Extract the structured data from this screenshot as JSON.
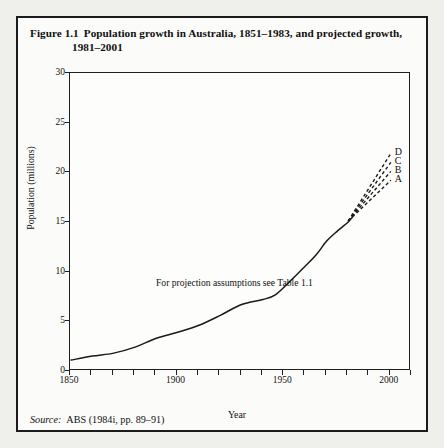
{
  "figure": {
    "number": "Figure 1.1",
    "caption_line1": "Population growth in Australia, 1851–1983, and projected growth,",
    "caption_line2": "1981–2001",
    "source_word": "Source:",
    "source_text": "ABS (1984i, pp. 89–91)",
    "annotation": "For projection assumptions see Table 1.1"
  },
  "chart_data": {
    "type": "line",
    "title": "Population growth in Australia, 1851–1983, and projected growth, 1981–2001",
    "xlabel": "Year",
    "ylabel": "Population (millions)",
    "xlim": [
      1850,
      2010
    ],
    "ylim": [
      0,
      30
    ],
    "xticks_labeled": [
      1850,
      1900,
      1950,
      2000
    ],
    "xticks_minor_step": 10,
    "yticks": [
      0,
      5,
      10,
      15,
      20,
      25,
      30
    ],
    "grid": false,
    "legend": "inline-labels",
    "annotations": [
      "For projection assumptions see Table 1.1"
    ],
    "series": [
      {
        "name": "Actual population 1851–1983",
        "style": "solid",
        "x": [
          1851,
          1861,
          1871,
          1881,
          1891,
          1901,
          1911,
          1921,
          1931,
          1941,
          1947,
          1954,
          1961,
          1966,
          1971,
          1976,
          1981,
          1983
        ],
        "values": [
          1.0,
          1.4,
          1.7,
          2.3,
          3.2,
          3.8,
          4.5,
          5.5,
          6.6,
          7.1,
          7.6,
          9.0,
          10.5,
          11.6,
          13.0,
          14.0,
          14.9,
          15.4
        ]
      },
      {
        "name": "A",
        "style": "dashed",
        "label": "A",
        "x": [
          1981,
          2001
        ],
        "values": [
          15.0,
          19.1
        ]
      },
      {
        "name": "B",
        "style": "dashed",
        "label": "B",
        "x": [
          1981,
          2001
        ],
        "values": [
          15.0,
          20.0
        ]
      },
      {
        "name": "C",
        "style": "dashed",
        "label": "C",
        "x": [
          1981,
          2001
        ],
        "values": [
          15.0,
          20.9
        ]
      },
      {
        "name": "D",
        "style": "dashed",
        "label": "D",
        "x": [
          1981,
          2001
        ],
        "values": [
          15.0,
          21.8
        ]
      }
    ]
  },
  "axes": {
    "y_ticks": [
      {
        "value": 30,
        "label": "30"
      },
      {
        "value": 25,
        "label": "25"
      },
      {
        "value": 20,
        "label": "20"
      },
      {
        "value": 15,
        "label": "15"
      },
      {
        "value": 10,
        "label": "10"
      },
      {
        "value": 5,
        "label": "5"
      },
      {
        "value": 0,
        "label": "0"
      }
    ],
    "x_ticks": [
      {
        "value": 1850,
        "label": "1850"
      },
      {
        "value": 1900,
        "label": "1900"
      },
      {
        "value": 1950,
        "label": "1950"
      },
      {
        "value": 2000,
        "label": "2000"
      }
    ]
  },
  "colors": {
    "ink": "#1b1b1b",
    "paper": "#fbfbf9",
    "page": "#efefec"
  }
}
